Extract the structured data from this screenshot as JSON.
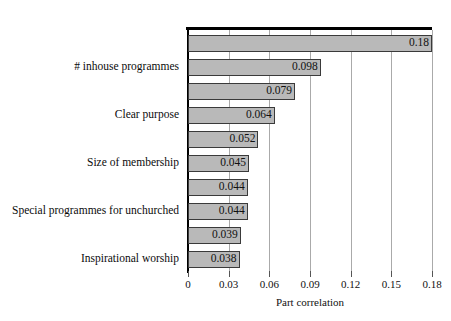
{
  "chart_data": {
    "type": "bar",
    "orientation": "horizontal",
    "title": "",
    "xlabel": "Part correlation",
    "ylabel": "",
    "xlim": [
      0,
      0.192
    ],
    "xticks": [
      0,
      0.03,
      0.06,
      0.09,
      0.12,
      0.15,
      0.18
    ],
    "xtick_labels": [
      "0",
      "0.03",
      "0.06",
      "0.09",
      "0.12",
      "0.15",
      "0.18"
    ],
    "grid": "vertical",
    "legend": "none",
    "bar_color": "#b9b9b9",
    "bar_edge_color": "#3a3a3a",
    "categories": [
      "",
      "# inhouse programmes",
      "",
      "Clear purpose",
      "",
      "Size of membership",
      "",
      "Special programmes for unchurched",
      "",
      "Inspirational worship"
    ],
    "values": [
      0.18,
      0.098,
      0.079,
      0.064,
      0.052,
      0.045,
      0.044,
      0.044,
      0.039,
      0.038
    ],
    "value_labels": [
      "0.18",
      "0.098",
      "0.079",
      "0.064",
      "0.052",
      "0.045",
      "0.044",
      "0.044",
      "0.039",
      "0.038"
    ]
  }
}
